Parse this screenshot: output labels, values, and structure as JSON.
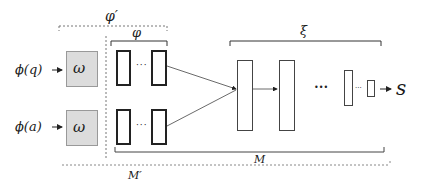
{
  "diagram": {
    "labels": {
      "phi_prime": "φ′",
      "phi": "φ",
      "xi": "ξ",
      "M": "M",
      "M_prime": "M′",
      "output": "s"
    },
    "inputs": [
      {
        "label": "ϕ(q)",
        "box": "ω"
      },
      {
        "label": "ϕ(a)",
        "box": "ω"
      }
    ],
    "ellipsis": "···",
    "ellipsis_big": "•••",
    "colors": {
      "omega_fill": "#dcdcdc",
      "stroke": "#222222",
      "thin_stroke": "#555555",
      "dashed": "#777777"
    }
  }
}
